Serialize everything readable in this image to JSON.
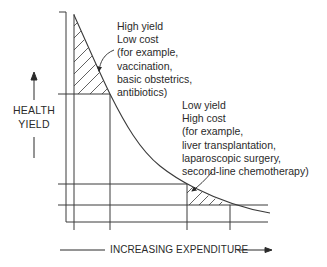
{
  "diagram": {
    "type": "cost-effectiveness curve",
    "y_axis_label": {
      "line1": "HEALTH",
      "line2": "YIELD",
      "direction": "up-arrow"
    },
    "x_axis_label": {
      "text": "INCREASING EXPENDITURE",
      "direction": "right-arrow"
    },
    "annotations": {
      "high_yield": {
        "title1": "High yield",
        "title2": "Low cost",
        "examples_intro": "(for example,",
        "examples": [
          "vaccination,",
          "basic obstetrics,",
          "antibiotics)"
        ]
      },
      "low_yield": {
        "title1": "Low yield",
        "title2": "High cost",
        "examples_intro": "(for example,",
        "examples": [
          "liver transplantation,",
          "laparoscopic surgery,",
          "second-line chemotherapy)"
        ]
      }
    },
    "colors": {
      "line": "#3a3a3a",
      "text": "#2a2a2a",
      "background": "#ffffff"
    }
  }
}
